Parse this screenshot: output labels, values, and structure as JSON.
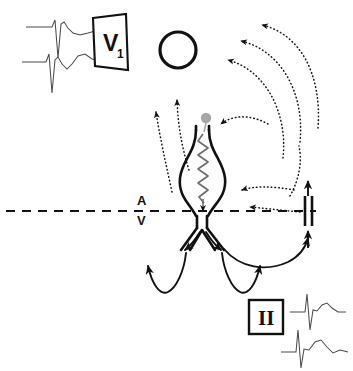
{
  "figure": {
    "background_color": "#ffffff",
    "line_color": "#111111",
    "marker_color": "#9a9a9a",
    "ecg_trace_color": "#4a4a4a"
  },
  "labels": {
    "lead_v1": "V",
    "lead_v1_subscript": "1",
    "lead_two": "II",
    "atrium": "A",
    "ventricle": "V"
  },
  "caption": {
    "text": ""
  },
  "legend_elements": {
    "dotted_arrow_meaning": "retrograde atrial activation",
    "solid_arrow_meaning": "ventricular activation",
    "block_symbol_meaning": "conduction block",
    "zigzag_meaning": "slow pathway conduction",
    "circle_meaning": "atrial chamber",
    "gray_dot_meaning": "earliest retrograde atrial activation site"
  }
}
